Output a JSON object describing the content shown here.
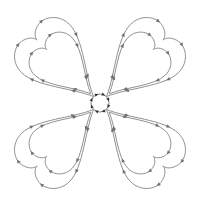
{
  "diagram": {
    "type": "four-heart-loops",
    "center": {
      "x": 100,
      "y": 103,
      "radius": 9
    },
    "colors": {
      "background": "#ffffff",
      "line": "#8a8a8a",
      "arrow": "#6e6e6e",
      "hub_marks": "#333333"
    },
    "hearts": [
      {
        "id": "top-left",
        "rotation": -45
      },
      {
        "id": "top-right",
        "rotation": 45
      },
      {
        "id": "bottom-right",
        "rotation": 135
      },
      {
        "id": "bottom-left",
        "rotation": 225
      }
    ],
    "loops_per_heart": 2,
    "arrow_icon": "triangle-arrow-icon"
  }
}
